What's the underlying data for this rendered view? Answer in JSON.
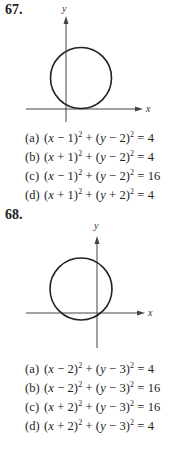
{
  "problems": [
    {
      "number": "67.",
      "graph": {
        "x_label": "x",
        "y_label": "y",
        "circle": "center (1,2), radius 2 (tangent to x-axis, crosses y-axis)"
      },
      "options": [
        {
          "label": "(a)",
          "equation": "(x − 1)² + (y − 2)² = 4"
        },
        {
          "label": "(b)",
          "equation": "(x + 1)² + (y − 2)² = 4"
        },
        {
          "label": "(c)",
          "equation": "(x − 1)² + (y − 2)² = 16"
        },
        {
          "label": "(d)",
          "equation": "(x + 1)² + (y + 2)² = 4"
        }
      ]
    },
    {
      "number": "68.",
      "graph": {
        "x_label": "x",
        "y_label": "y",
        "circle": "center (−2,3), radius ~4 (crosses both axes)"
      },
      "options": [
        {
          "label": "(a)",
          "equation": "(x − 2)² + (y − 3)² = 4"
        },
        {
          "label": "(b)",
          "equation": "(x − 2)² + (y − 3)² = 16"
        },
        {
          "label": "(c)",
          "equation": "(x + 2)² + (y − 3)² = 16"
        },
        {
          "label": "(d)",
          "equation": "(x + 2)² + (y − 3)² = 4"
        }
      ]
    }
  ]
}
